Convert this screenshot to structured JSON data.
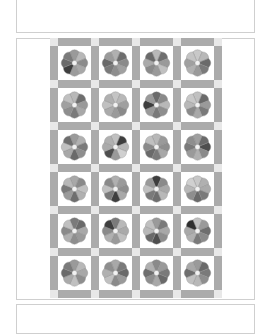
{
  "quilt": {
    "pattern": "Dresden Plate flower blocks with sashing and cornerstones",
    "rows": 6,
    "cols": 4,
    "colors": {
      "sashing": "#ababab",
      "cornerstone": "#e8e8e8",
      "block_background": "#ffffff",
      "flower_center": "#f2f2f2",
      "panel_border": "#cfcfcf"
    },
    "blocks": [
      [
        [
          "#9a9a9a",
          "#b8b8b8",
          "#8c8c8c",
          "#a8a8a8",
          "#9c9c9c",
          "#3e3e3e",
          "#6a6a6a",
          "#7a7a7a"
        ],
        [
          "#b0b0b0",
          "#6e6e6e",
          "#8a8a8a",
          "#a0a0a0",
          "#8e8e8e",
          "#7a7a7a",
          "#6a6a6a",
          "#9a9a9a"
        ],
        [
          "#b8b8b8",
          "#6e6e6e",
          "#9a9a9a",
          "#c0c0c0",
          "#9a9a9a",
          "#8a8a8a",
          "#aaaaaa",
          "#6a6a6a"
        ],
        [
          "#c8c8c8",
          "#b8b8b8",
          "#6a6a6a",
          "#7a7a7a",
          "#9a9a9a",
          "#b0b0b0",
          "#a0a0a0",
          "#c4c4c4"
        ]
      ],
      [
        [
          "#b8b8b8",
          "#6e6e6e",
          "#9a9a9a",
          "#a8a8a8",
          "#7a7a7a",
          "#8e8e8e",
          "#a0a0a0",
          "#c0c0c0"
        ],
        [
          "#c4c4c4",
          "#b8b8b8",
          "#a0a0a0",
          "#8a8a8a",
          "#9a9a9a",
          "#aaaaaa",
          "#c0c0c0",
          "#b0b0b0"
        ],
        [
          "#6a6a6a",
          "#8a8a8a",
          "#b8b8b8",
          "#8e8e8e",
          "#7a7a7a",
          "#9a9a9a",
          "#3e3e3e",
          "#9a9a9a"
        ],
        [
          "#c0c0c0",
          "#6a6a6a",
          "#9a9a9a",
          "#7a7a7a",
          "#a8a8a8",
          "#8a8a8a",
          "#b8b8b8",
          "#c8c8c8"
        ]
      ],
      [
        [
          "#9a9a9a",
          "#b0b0b0",
          "#7a7a7a",
          "#8e8e8e",
          "#6a6a6a",
          "#a8a8a8",
          "#c0c0c0",
          "#6e6e6e"
        ],
        [
          "#c0c0c0",
          "#3e3e3e",
          "#b8b8b8",
          "#d0d0d0",
          "#9a9a9a",
          "#4e4e4e",
          "#aaaaaa",
          "#b0b0b0"
        ],
        [
          "#b8b8b8",
          "#9a9a9a",
          "#8e8e8e",
          "#a8a8a8",
          "#7a7a7a",
          "#6a6a6a",
          "#8a8a8a",
          "#c0c0c0"
        ],
        [
          "#a0a0a0",
          "#6a6a6a",
          "#4e4e4e",
          "#8a8a8a",
          "#b0b0b0",
          "#9a9a9a",
          "#7a7a7a",
          "#8e8e8e"
        ]
      ],
      [
        [
          "#a8a8a8",
          "#8a8a8a",
          "#c0c0c0",
          "#b0b0b0",
          "#6e6e6e",
          "#9a9a9a",
          "#7a7a7a",
          "#b8b8b8"
        ],
        [
          "#b0b0b0",
          "#9a9a9a",
          "#8e8e8e",
          "#a8a8a8",
          "#3e3e3e",
          "#7a7a7a",
          "#c0c0c0",
          "#8a8a8a"
        ],
        [
          "#3e3e3e",
          "#8a8a8a",
          "#a8a8a8",
          "#b8b8b8",
          "#6e6e6e",
          "#7a7a7a",
          "#c0c0c0",
          "#9a9a9a"
        ],
        [
          "#c8c8c8",
          "#b0b0b0",
          "#aaaaaa",
          "#7a7a7a",
          "#6a6a6a",
          "#8e8e8e",
          "#b8b8b8",
          "#d0d0d0"
        ]
      ],
      [
        [
          "#7a7a7a",
          "#6a6a6a",
          "#a8a8a8",
          "#9a9a9a",
          "#8e8e8e",
          "#b0b0b0",
          "#8a8a8a",
          "#c0c0c0"
        ],
        [
          "#7a7a7a",
          "#b8b8b8",
          "#aaaaaa",
          "#c0c0c0",
          "#9a9a9a",
          "#b0b0b0",
          "#8a8a8a",
          "#3e3e3e"
        ],
        [
          "#9a9a9a",
          "#7a7a7a",
          "#a8a8a8",
          "#8e8e8e",
          "#4e4e4e",
          "#6a6a6a",
          "#b8b8b8",
          "#c0c0c0"
        ],
        [
          "#c0c0c0",
          "#9a9a9a",
          "#6e6e6e",
          "#8a8a8a",
          "#7a7a7a",
          "#b0b0b0",
          "#a8a8a8",
          "#2e2e2e"
        ]
      ],
      [
        [
          "#9a9a9a",
          "#b8b8b8",
          "#a8a8a8",
          "#8e8e8e",
          "#c0c0c0",
          "#aaaaaa",
          "#6a6a6a",
          "#7a7a7a"
        ],
        [
          "#a8a8a8",
          "#7a7a7a",
          "#6a6a6a",
          "#9a9a9a",
          "#8a8a8a",
          "#c0c0c0",
          "#b0b0b0",
          "#8e8e8e"
        ],
        [
          "#8a8a8a",
          "#9a9a9a",
          "#7a7a7a",
          "#6a6a6a",
          "#a8a8a8",
          "#8e8e8e",
          "#6e6e6e",
          "#b0b0b0"
        ],
        [
          "#9a9a9a",
          "#6a6a6a",
          "#7a7a7a",
          "#8e8e8e",
          "#b8b8b8",
          "#c0c0c0",
          "#6e6e6e",
          "#a8a8a8"
        ]
      ]
    ]
  }
}
